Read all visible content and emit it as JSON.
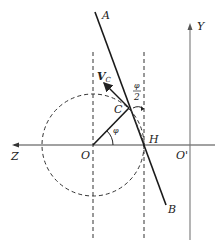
{
  "diagram": {
    "type": "geometry",
    "labels": {
      "A": "A",
      "B": "B",
      "C": "C",
      "H": "H",
      "O": "O",
      "O_prime": "O'",
      "Z": "Z",
      "Y": "Y",
      "velocity": "V",
      "velocity_sub": "C",
      "phi": "φ",
      "half_phi_num": "φ",
      "half_phi_den": "2"
    },
    "colors": {
      "line": "#1a1a1a",
      "dashed": "#333333",
      "axis": "#555555"
    }
  }
}
